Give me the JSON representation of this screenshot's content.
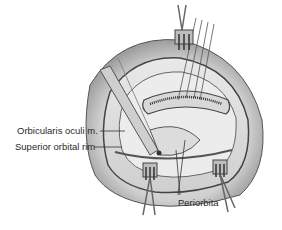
{
  "figure": {
    "labels": [
      {
        "id": "orbicularis",
        "text": "Orbicularis oculi m."
      },
      {
        "id": "superior-rim",
        "text": "Superior orbital rim"
      },
      {
        "id": "periorbita",
        "text": "Periorbita"
      }
    ],
    "colors": {
      "background": "#ffffff",
      "line": "#3a3a3a",
      "tissue_light": "#e6e6e6",
      "tissue_mid": "#b5b5b5",
      "tissue_dark": "#6a6a6a",
      "text": "#2a2a2a"
    }
  }
}
